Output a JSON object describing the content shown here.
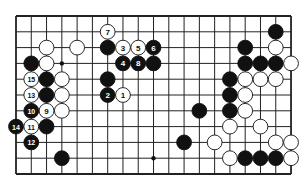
{
  "diagram": {
    "type": "go-board-fragment",
    "columns": 19,
    "rows": 11,
    "origin": [
      16,
      16
    ],
    "spacing": [
      15.28,
      15.8
    ],
    "stone_radius": 7.4,
    "colors": {
      "black": "#111111",
      "white": "#ffffff",
      "line": "#222222",
      "label_on_black": "#ffffff",
      "label_on_white": "#111111"
    },
    "star_points": [
      [
        3,
        3
      ],
      [
        9,
        9
      ]
    ],
    "stones": [
      {
        "c": 6,
        "r": 1,
        "color": "white",
        "label": "7"
      },
      {
        "c": 17,
        "r": 1,
        "color": "black",
        "label": ""
      },
      {
        "c": 2,
        "r": 2,
        "color": "white",
        "label": ""
      },
      {
        "c": 4,
        "r": 2,
        "color": "white",
        "label": ""
      },
      {
        "c": 6,
        "r": 2,
        "color": "black",
        "label": ""
      },
      {
        "c": 7,
        "r": 2,
        "color": "white",
        "label": "3"
      },
      {
        "c": 8,
        "r": 2,
        "color": "white",
        "label": "5"
      },
      {
        "c": 9,
        "r": 2,
        "color": "black",
        "label": "6"
      },
      {
        "c": 15,
        "r": 2,
        "color": "black",
        "label": ""
      },
      {
        "c": 17,
        "r": 2,
        "color": "white",
        "label": ""
      },
      {
        "c": 1,
        "r": 3,
        "color": "black",
        "label": ""
      },
      {
        "c": 2,
        "r": 3,
        "color": "white",
        "label": ""
      },
      {
        "c": 7,
        "r": 3,
        "color": "black",
        "label": "4"
      },
      {
        "c": 8,
        "r": 3,
        "color": "black",
        "label": "8"
      },
      {
        "c": 9,
        "r": 3,
        "color": "black",
        "label": ""
      },
      {
        "c": 15,
        "r": 3,
        "color": "black",
        "label": ""
      },
      {
        "c": 16,
        "r": 3,
        "color": "black",
        "label": ""
      },
      {
        "c": 17,
        "r": 3,
        "color": "black",
        "label": ""
      },
      {
        "c": 18,
        "r": 3,
        "color": "white",
        "label": ""
      },
      {
        "c": 1,
        "r": 4,
        "color": "white",
        "label": "15"
      },
      {
        "c": 2,
        "r": 4,
        "color": "black",
        "label": ""
      },
      {
        "c": 3,
        "r": 4,
        "color": "white",
        "label": ""
      },
      {
        "c": 6,
        "r": 4,
        "color": "black",
        "label": ""
      },
      {
        "c": 14,
        "r": 4,
        "color": "black",
        "label": ""
      },
      {
        "c": 15,
        "r": 4,
        "color": "white",
        "label": ""
      },
      {
        "c": 16,
        "r": 4,
        "color": "white",
        "label": ""
      },
      {
        "c": 17,
        "r": 4,
        "color": "white",
        "label": ""
      },
      {
        "c": 1,
        "r": 5,
        "color": "white",
        "label": "13"
      },
      {
        "c": 2,
        "r": 5,
        "color": "black",
        "label": ""
      },
      {
        "c": 3,
        "r": 5,
        "color": "white",
        "label": ""
      },
      {
        "c": 6,
        "r": 5,
        "color": "black",
        "label": "2"
      },
      {
        "c": 7,
        "r": 5,
        "color": "white",
        "label": "1"
      },
      {
        "c": 14,
        "r": 5,
        "color": "black",
        "label": ""
      },
      {
        "c": 15,
        "r": 5,
        "color": "white",
        "label": ""
      },
      {
        "c": 1,
        "r": 6,
        "color": "black",
        "label": "10"
      },
      {
        "c": 2,
        "r": 6,
        "color": "white",
        "label": "9"
      },
      {
        "c": 3,
        "r": 6,
        "color": "white",
        "label": ""
      },
      {
        "c": 12,
        "r": 6,
        "color": "black",
        "label": ""
      },
      {
        "c": 14,
        "r": 6,
        "color": "black",
        "label": ""
      },
      {
        "c": 15,
        "r": 6,
        "color": "white",
        "label": ""
      },
      {
        "c": 0,
        "r": 7,
        "color": "black",
        "label": "14"
      },
      {
        "c": 1,
        "r": 7,
        "color": "white",
        "label": "11"
      },
      {
        "c": 2,
        "r": 7,
        "color": "black",
        "label": ""
      },
      {
        "c": 14,
        "r": 7,
        "color": "white",
        "label": ""
      },
      {
        "c": 16,
        "r": 7,
        "color": "white",
        "label": ""
      },
      {
        "c": 1,
        "r": 8,
        "color": "black",
        "label": "12"
      },
      {
        "c": 11,
        "r": 8,
        "color": "black",
        "label": ""
      },
      {
        "c": 13,
        "r": 8,
        "color": "white",
        "label": ""
      },
      {
        "c": 17,
        "r": 8,
        "color": "white",
        "label": ""
      },
      {
        "c": 18,
        "r": 8,
        "color": "white",
        "label": ""
      },
      {
        "c": 3,
        "r": 9,
        "color": "black",
        "label": ""
      },
      {
        "c": 14,
        "r": 9,
        "color": "white",
        "label": ""
      },
      {
        "c": 15,
        "r": 9,
        "color": "black",
        "label": ""
      },
      {
        "c": 16,
        "r": 9,
        "color": "black",
        "label": ""
      },
      {
        "c": 17,
        "r": 9,
        "color": "black",
        "label": ""
      },
      {
        "c": 18,
        "r": 9,
        "color": "white",
        "label": ""
      }
    ]
  }
}
